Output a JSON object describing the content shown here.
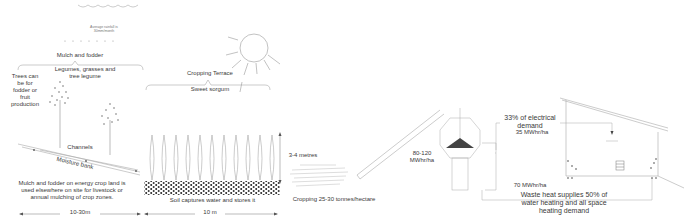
{
  "rainfall": {
    "label": "Average rainfall is 30mm/month"
  },
  "left_panel": {
    "mulch_title": "Mulch and fodder",
    "legumes_label": "Legumes, grasses and tree legume",
    "trees_label": "Trees can be for fodder or fruit production",
    "channels_label": "Channels",
    "moisture_bank_label": "Moisture bank",
    "mulch_note": "Mulch and fodder on energy crop land is used elsewhere on site for livestock or annual mulching of crop zones.",
    "width_label": "10-30m"
  },
  "cropping_panel": {
    "terrace_title": "Cropping Terrace",
    "crop_label": "Sweet sorgum",
    "height_label": "3-4 metres",
    "soil_label": "Soil captures water and stores it",
    "width_label": "10 m"
  },
  "harvest": {
    "yield_label": "Cropping 25-30 tonnes/hectare"
  },
  "energy": {
    "output_label": "80-120 MWhr/ha",
    "electrical_label": "33% of electrical demand",
    "electrical_value": "35 MWhr/ha",
    "heat_value": "70 MWhr/ha",
    "waste_heat_label": "Waste heat supplies 50% of water heating  and all space heating demand"
  },
  "colors": {
    "line": "#9a9a9a",
    "text": "#3a3a3a",
    "soil_dots": "#222222",
    "background": "#ffffff"
  }
}
